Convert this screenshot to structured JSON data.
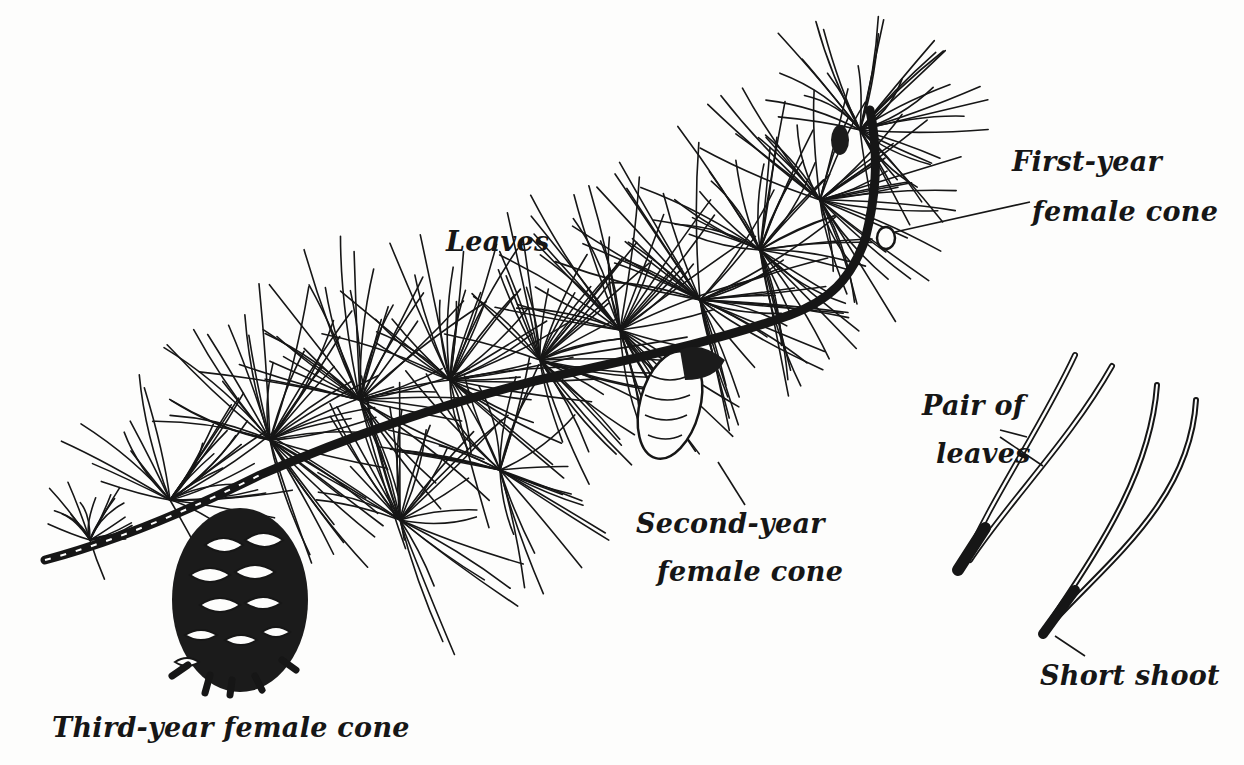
{
  "figure": {
    "background": "#fdfdfc",
    "ink": "#161616"
  },
  "labels": {
    "leaves": "Leaves",
    "first_year_line1": "First-year",
    "first_year_line2": "female cone",
    "second_year_line1": "Second-year",
    "second_year_line2": "female cone",
    "third_year": "Third-year female cone",
    "pair_line1": "Pair of",
    "pair_line2": "leaves",
    "short_shoot": "Short shoot"
  }
}
